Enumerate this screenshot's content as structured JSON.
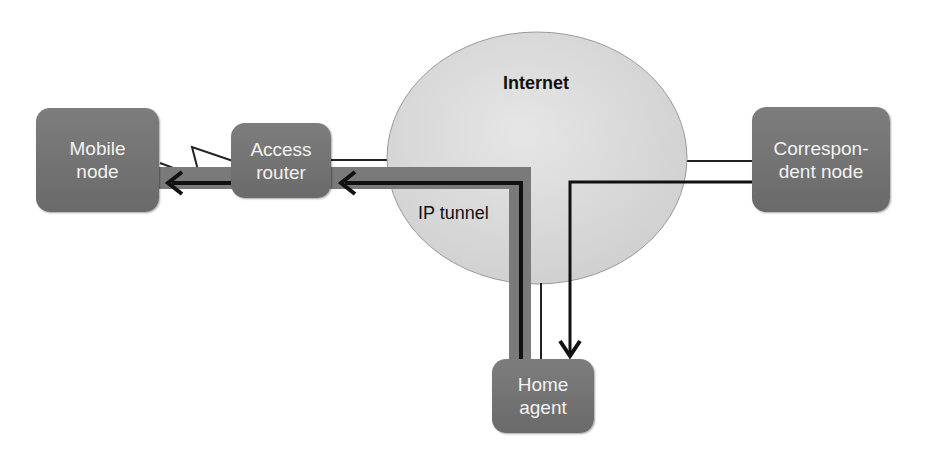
{
  "diagram": {
    "internet_label": "Internet",
    "tunnel_label": "IP tunnel",
    "nodes": {
      "mobile_node": "Mobile\nnode",
      "access_router": "Access\nrouter",
      "correspondent_node": "Correspon-\ndent node",
      "home_agent": "Home\nagent"
    },
    "colors": {
      "node_fill": "#707070",
      "cloud_fill": "#dcdcdc",
      "tunnel": "#7a7a7a",
      "arrow": "#111111"
    }
  }
}
